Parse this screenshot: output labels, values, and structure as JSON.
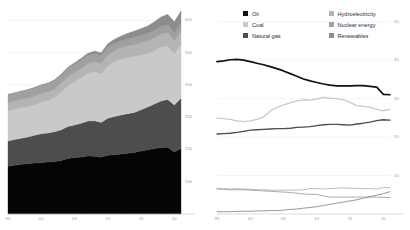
{
  "figure": {
    "background": "#ffffff",
    "panels": [
      "stacked-area",
      "line"
    ]
  },
  "legend": {
    "position": "top-center-right-panel",
    "columns": 2,
    "items": [
      {
        "label": "Oil",
        "color": "#111111",
        "key": "oil"
      },
      {
        "label": "Hydroelectricity",
        "color": "#b4b4b4",
        "key": "hydro"
      },
      {
        "label": "Coal",
        "color": "#c9c9c9",
        "key": "coal"
      },
      {
        "label": "Nuclear energy",
        "color": "#a0a0a0",
        "key": "nuclear"
      },
      {
        "label": "Natural gas",
        "color": "#4d4d4d",
        "key": "gas"
      },
      {
        "label": "Renewables",
        "color": "#8c8c8c",
        "key": "renewables"
      }
    ]
  },
  "chart_data": [
    {
      "type": "area",
      "stacked": true,
      "title": "",
      "xlabel": "",
      "ylabel": "",
      "grid": true,
      "legend_position": "none",
      "yaxis_side": "right",
      "xlim": [
        1995,
        2021
      ],
      "ylim": [
        0,
        620
      ],
      "yticks": [
        100,
        200,
        300,
        400,
        500,
        600
      ],
      "ytick_labels": [
        "100",
        "200",
        "300",
        "400",
        "500",
        "600"
      ],
      "xticks": [
        1995,
        2000,
        2005,
        2010,
        2015,
        2020
      ],
      "xtick_labels": [
        "95",
        "00",
        "05",
        "10",
        "15",
        "20"
      ],
      "x": [
        1995,
        1996,
        1997,
        1998,
        1999,
        2000,
        2001,
        2002,
        2003,
        2004,
        2005,
        2006,
        2007,
        2008,
        2009,
        2010,
        2011,
        2012,
        2013,
        2014,
        2015,
        2016,
        2017,
        2018,
        2019,
        2020,
        2021
      ],
      "series": [
        {
          "name": "Oil",
          "color": "#050505",
          "values": [
            148,
            151,
            154,
            156,
            158,
            160,
            161,
            163,
            166,
            172,
            175,
            177,
            180,
            179,
            176,
            182,
            184,
            186,
            188,
            191,
            195,
            199,
            203,
            206,
            207,
            192,
            203
          ]
        },
        {
          "name": "Natural gas",
          "color": "#4d4d4d",
          "values": [
            78,
            80,
            81,
            83,
            86,
            89,
            90,
            92,
            95,
            99,
            101,
            104,
            108,
            110,
            108,
            115,
            118,
            121,
            123,
            124,
            128,
            133,
            138,
            144,
            148,
            146,
            156
          ]
        },
        {
          "name": "Coal",
          "color": "#c9c9c9",
          "values": [
            94,
            94,
            95,
            94,
            95,
            98,
            101,
            106,
            117,
            126,
            134,
            141,
            148,
            152,
            151,
            162,
            170,
            173,
            174,
            173,
            170,
            165,
            166,
            168,
            166,
            159,
            167
          ]
        },
        {
          "name": "Hydroelectricity",
          "color": "#b4b4b4",
          "values": [
            25,
            25,
            25,
            26,
            26,
            26,
            26,
            26,
            27,
            28,
            28,
            29,
            30,
            31,
            32,
            33,
            34,
            35,
            36,
            37,
            38,
            39,
            39,
            40,
            41,
            41,
            41
          ]
        },
        {
          "name": "Nuclear energy",
          "color": "#a0a0a0",
          "values": [
            24,
            24,
            24,
            24,
            25,
            25,
            25,
            25,
            25,
            26,
            26,
            26,
            25,
            25,
            24,
            25,
            23,
            22,
            22,
            23,
            23,
            24,
            24,
            24,
            25,
            24,
            25
          ]
        },
        {
          "name": "Renewables",
          "color": "#8c8c8c",
          "values": [
            2,
            2,
            2,
            3,
            3,
            3,
            3,
            4,
            4,
            4,
            5,
            6,
            7,
            8,
            9,
            11,
            13,
            15,
            17,
            19,
            21,
            23,
            26,
            29,
            32,
            34,
            38
          ]
        }
      ]
    },
    {
      "type": "line",
      "title": "",
      "xlabel": "",
      "ylabel": "",
      "grid": true,
      "legend_position": "top",
      "yaxis_side": "right",
      "unit": "percent",
      "xlim": [
        1995,
        2021
      ],
      "ylim": [
        0,
        52
      ],
      "yticks": [
        10,
        20,
        30,
        40,
        50
      ],
      "ytick_labels": [
        "10",
        "20",
        "30",
        "40",
        "50"
      ],
      "xticks": [
        1995,
        2000,
        2005,
        2010,
        2015,
        2020
      ],
      "xtick_labels": [
        "95",
        "00",
        "05",
        "10",
        "15",
        "20"
      ],
      "x": [
        1995,
        1996,
        1997,
        1998,
        1999,
        2000,
        2001,
        2002,
        2003,
        2004,
        2005,
        2006,
        2007,
        2008,
        2009,
        2010,
        2011,
        2012,
        2013,
        2014,
        2015,
        2016,
        2017,
        2018,
        2019,
        2020,
        2021
      ],
      "series": [
        {
          "name": "Oil",
          "color": "#111111",
          "width": 1.7,
          "values": [
            39.6,
            39.8,
            40.1,
            40.2,
            40.0,
            39.6,
            39.2,
            38.8,
            38.3,
            37.8,
            37.2,
            36.5,
            35.8,
            35.1,
            34.6,
            34.2,
            33.8,
            33.5,
            33.3,
            33.3,
            33.3,
            33.4,
            33.4,
            33.2,
            33.0,
            31.1,
            31.0
          ]
        },
        {
          "name": "Coal",
          "color": "#c9c9c9",
          "width": 1.3,
          "values": [
            25.0,
            24.8,
            24.6,
            24.2,
            24.0,
            24.2,
            24.6,
            25.2,
            26.8,
            27.7,
            28.4,
            28.9,
            29.4,
            29.7,
            29.6,
            29.9,
            30.3,
            30.1,
            30.0,
            29.7,
            29.0,
            28.2,
            28.0,
            27.8,
            27.2,
            26.8,
            27.2
          ]
        },
        {
          "name": "Natural gas",
          "color": "#4d4d4d",
          "width": 1.3,
          "values": [
            20.8,
            20.9,
            21.0,
            21.2,
            21.5,
            21.8,
            21.9,
            22.0,
            22.1,
            22.2,
            22.2,
            22.3,
            22.5,
            22.6,
            22.7,
            23.0,
            23.2,
            23.3,
            23.3,
            23.2,
            23.1,
            23.4,
            23.6,
            23.9,
            24.3,
            24.5,
            24.4
          ]
        },
        {
          "name": "Hydroelectricity",
          "color": "#b4b4b4",
          "width": 0.9,
          "values": [
            6.7,
            6.6,
            6.5,
            6.6,
            6.5,
            6.4,
            6.3,
            6.3,
            6.2,
            6.2,
            6.2,
            6.2,
            6.2,
            6.3,
            6.6,
            6.6,
            6.5,
            6.6,
            6.7,
            6.8,
            6.7,
            6.7,
            6.6,
            6.6,
            6.5,
            6.9,
            6.8
          ]
        },
        {
          "name": "Nuclear energy",
          "color": "#a0a0a0",
          "width": 0.9,
          "values": [
            6.5,
            6.4,
            6.3,
            6.3,
            6.3,
            6.2,
            6.1,
            6.0,
            5.9,
            5.8,
            5.7,
            5.6,
            5.4,
            5.2,
            5.1,
            5.1,
            4.7,
            4.4,
            4.4,
            4.4,
            4.4,
            4.4,
            4.4,
            4.4,
            4.4,
            4.3,
            4.3
          ]
        },
        {
          "name": "Renewables",
          "color": "#8c8c8c",
          "width": 0.9,
          "values": [
            0.6,
            0.6,
            0.6,
            0.7,
            0.7,
            0.7,
            0.8,
            0.8,
            0.9,
            0.9,
            1.0,
            1.2,
            1.3,
            1.5,
            1.7,
            1.9,
            2.2,
            2.5,
            2.8,
            3.1,
            3.4,
            3.7,
            4.1,
            4.5,
            4.9,
            5.3,
            5.8
          ]
        }
      ]
    }
  ]
}
